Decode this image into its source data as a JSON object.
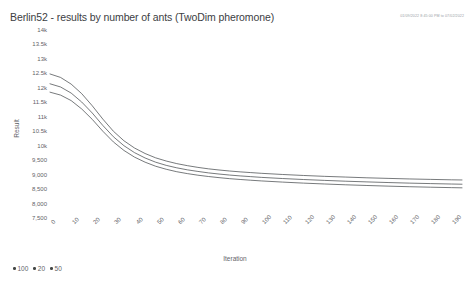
{
  "header": {
    "title": "Berlin52 - results by number of ants (TwoDim pheromone)",
    "timestamp": "01/09/2022 8:45:00 PM to 07/02/2022"
  },
  "chart_data": {
    "type": "line",
    "title": "Berlin52 - results by number of ants (TwoDim pheromone)",
    "xlabel": "Iteration",
    "ylabel": "Result",
    "xlim": [
      0,
      195
    ],
    "ylim": [
      7500,
      14000
    ],
    "grid": false,
    "legend_position": "bottom-left",
    "x_tick_labels": [
      "0",
      "10",
      "20",
      "30",
      "40",
      "50",
      "60",
      "70",
      "80",
      "90",
      "100",
      "110",
      "120",
      "130",
      "140",
      "150",
      "160",
      "170",
      "180",
      "190"
    ],
    "x_ticks": [
      0,
      10,
      20,
      30,
      40,
      50,
      60,
      70,
      80,
      90,
      100,
      110,
      120,
      130,
      140,
      150,
      160,
      170,
      180,
      190
    ],
    "y_ticks": [
      7500,
      8000,
      8500,
      9000,
      9500,
      10000,
      10500,
      11000,
      11500,
      12000,
      12500,
      13000,
      13500,
      14000
    ],
    "y_tick_labels": [
      "7,500",
      "8,000",
      "8,500",
      "9,000",
      "9,500",
      "10k",
      "10.5k",
      "11k",
      "11.5k",
      "12k",
      "12.5k",
      "13k",
      "13.5k",
      "14k"
    ],
    "x": [
      0,
      5,
      10,
      15,
      20,
      25,
      30,
      35,
      40,
      45,
      50,
      55,
      60,
      65,
      70,
      75,
      80,
      85,
      90,
      95,
      100,
      110,
      120,
      130,
      140,
      150,
      160,
      170,
      180,
      190,
      195
    ],
    "series": [
      {
        "name": "100",
        "color": "#3c4043",
        "values": [
          12480,
          12360,
          12130,
          11800,
          11380,
          10920,
          10500,
          10170,
          9920,
          9730,
          9580,
          9470,
          9380,
          9310,
          9250,
          9200,
          9160,
          9125,
          9095,
          9070,
          9045,
          9005,
          8970,
          8940,
          8915,
          8890,
          8870,
          8850,
          8835,
          8820,
          8815
        ]
      },
      {
        "name": "20",
        "color": "#3c4043",
        "values": [
          12140,
          12030,
          11820,
          11510,
          11130,
          10700,
          10310,
          10000,
          9760,
          9575,
          9430,
          9320,
          9235,
          9165,
          9110,
          9060,
          9020,
          8985,
          8955,
          8930,
          8905,
          8865,
          8830,
          8800,
          8772,
          8748,
          8726,
          8706,
          8690,
          8675,
          8668
        ]
      },
      {
        "name": "50",
        "color": "#3c4043",
        "values": [
          11850,
          11750,
          11560,
          11270,
          10910,
          10500,
          10130,
          9835,
          9605,
          9430,
          9290,
          9185,
          9100,
          9035,
          8980,
          8935,
          8895,
          8860,
          8832,
          8806,
          8782,
          8742,
          8706,
          8676,
          8648,
          8624,
          8602,
          8582,
          8565,
          8550,
          8543
        ]
      }
    ]
  },
  "legend": {
    "items": [
      {
        "label": "100"
      },
      {
        "label": "20"
      },
      {
        "label": "50"
      }
    ]
  }
}
